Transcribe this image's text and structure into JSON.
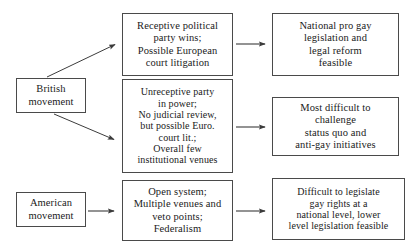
{
  "diagram": {
    "type": "flowchart",
    "nodes": [
      {
        "id": "british-movement",
        "label": "British\nmovement",
        "column": "left",
        "x": 16,
        "y": 78,
        "w": 70,
        "h": 35
      },
      {
        "id": "american-movement",
        "label": "American\nmovement",
        "column": "left",
        "x": 16,
        "y": 192,
        "w": 70,
        "h": 35
      },
      {
        "id": "receptive-party",
        "label": "Receptive political\nparty wins;\nPossible European\ncourt litigation",
        "column": "middle",
        "x": 122,
        "y": 13,
        "w": 111,
        "h": 63
      },
      {
        "id": "unreceptive-party",
        "label": "Unreceptive party\nin power;\nNo judicial review,\nbut possible Euro.\ncourt lit.;\nOverall few\ninstitutional venues",
        "column": "middle",
        "x": 122,
        "y": 79,
        "w": 111,
        "h": 94
      },
      {
        "id": "open-system",
        "label": "Open system;\nMultiple venues and\nveto points;\nFederalism",
        "column": "middle",
        "x": 122,
        "y": 180,
        "w": 111,
        "h": 61
      },
      {
        "id": "national-pro-gay",
        "label": "National pro gay\nlegislation and\nlegal reform\nfeasible",
        "column": "right",
        "x": 272,
        "y": 13,
        "w": 127,
        "h": 63
      },
      {
        "id": "most-difficult",
        "label": "Most difficult to\nchallenge\nstatus quo  and\nanti-gay initiatives",
        "column": "right",
        "x": 272,
        "y": 97,
        "w": 127,
        "h": 59
      },
      {
        "id": "difficult-legislate",
        "label": "Difficult to legislate\ngay rights at a\nnational level, lower\nlevel legislation feasible",
        "column": "right",
        "x": 272,
        "y": 178,
        "w": 133,
        "h": 62
      }
    ],
    "edges": [
      {
        "id": "british-to-receptive",
        "from": "british-movement",
        "to": "receptive-party",
        "kind": "diagonal-up",
        "x1": 47,
        "y1": 77,
        "x2": 119,
        "y2": 43
      },
      {
        "id": "british-to-unreceptive",
        "from": "british-movement",
        "to": "unreceptive-party",
        "kind": "diagonal-down",
        "x1": 54,
        "y1": 114,
        "x2": 119,
        "y2": 141
      },
      {
        "id": "american-to-open-system",
        "from": "american-movement",
        "to": "open-system",
        "kind": "horizontal",
        "x1": 88,
        "y1": 211,
        "x2": 119,
        "y2": 211
      },
      {
        "id": "receptive-to-national",
        "from": "receptive-party",
        "to": "national-pro-gay",
        "kind": "horizontal",
        "x1": 236,
        "y1": 44,
        "x2": 269,
        "y2": 44
      },
      {
        "id": "unreceptive-to-most-difficult",
        "from": "unreceptive-party",
        "to": "most-difficult",
        "kind": "horizontal",
        "x1": 236,
        "y1": 127,
        "x2": 269,
        "y2": 127
      },
      {
        "id": "open-system-to-difficult",
        "from": "open-system",
        "to": "difficult-legislate",
        "kind": "horizontal",
        "x1": 236,
        "y1": 211,
        "x2": 269,
        "y2": 211
      }
    ],
    "colors": {
      "background": "#ffffff",
      "box_border": "#4a4a4a",
      "text": "#1a1a1a",
      "edge": "#2b2b2b"
    }
  }
}
